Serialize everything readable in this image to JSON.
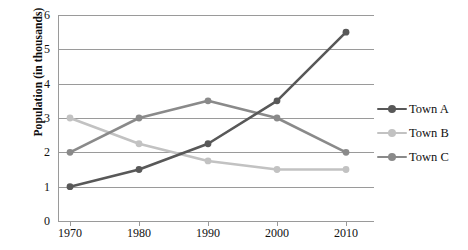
{
  "chart_data": {
    "type": "line",
    "title": "",
    "xlabel": "",
    "ylabel": "Population (in thousands)",
    "categories": [
      "1970",
      "1980",
      "1990",
      "2000",
      "2010"
    ],
    "x": [
      1970,
      1980,
      1990,
      2000,
      2010
    ],
    "xlim": [
      1965,
      2015
    ],
    "ylim": [
      0,
      6
    ],
    "yticks": [
      "0",
      "1",
      "2",
      "3",
      "4",
      "5",
      "6"
    ],
    "ytick_values": [
      0,
      1,
      2,
      3,
      4,
      5,
      6
    ],
    "grid": "horizontal",
    "legend_position": "right",
    "series": [
      {
        "name": "Town A",
        "color": "#585858",
        "values": [
          1.0,
          1.5,
          2.25,
          3.5,
          5.5
        ]
      },
      {
        "name": "Town B",
        "color": "#c2c2c2",
        "values": [
          3.0,
          2.25,
          1.75,
          1.5,
          1.5
        ]
      },
      {
        "name": "Town C",
        "color": "#8a8a8a",
        "values": [
          2.0,
          3.0,
          3.5,
          3.0,
          2.0
        ]
      }
    ]
  },
  "legend": {
    "items": [
      {
        "label": "Town A",
        "color": "#585858"
      },
      {
        "label": "Town B",
        "color": "#c2c2c2"
      },
      {
        "label": "Town C",
        "color": "#8a8a8a"
      }
    ]
  },
  "axes": {
    "y_title": "Population (in thousands)",
    "grid_color": "#9a9a9a"
  }
}
